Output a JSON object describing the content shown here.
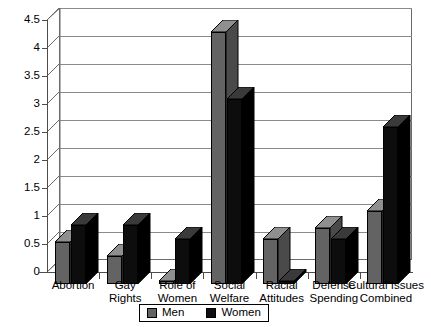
{
  "chart_data": {
    "type": "bar",
    "title": "",
    "subtitle": "",
    "xlabel": "",
    "ylabel": "",
    "ylim": [
      0,
      4.5
    ],
    "ytick_values": [
      0,
      0.5,
      1,
      1.5,
      2,
      2.5,
      3,
      3.5,
      4,
      4.5
    ],
    "ytick_labels": [
      "0",
      "0.5",
      "1",
      "1.5",
      "2",
      "2.5",
      "3",
      "3.5",
      "4",
      "4.5"
    ],
    "grid": true,
    "legend_position": "bottom",
    "style": "3d-clustered-column",
    "categories": [
      "Abortion",
      "Gay\nRights",
      "Role of\nWomen",
      "Social\nWelfare",
      "Racial\nAttitudes",
      "Defense\nSpending",
      "Cultural Issues\nCombined"
    ],
    "series": [
      {
        "name": "Men",
        "color": "#636363",
        "values": [
          0.75,
          0.5,
          0.05,
          4.5,
          0.8,
          1.0,
          1.3
        ]
      },
      {
        "name": "Women",
        "color": "#0d0d0d",
        "values": [
          1.05,
          1.05,
          0.8,
          3.3,
          0.05,
          0.8,
          2.8
        ]
      }
    ]
  },
  "legend": {
    "items": [
      {
        "label": "Men",
        "swatch": "men-color-swatch"
      },
      {
        "label": "Women",
        "swatch": "women-color-swatch"
      }
    ]
  },
  "colors": {
    "men": "#636363",
    "women": "#0d0d0d",
    "grid": "#8a8a8a",
    "axis": "#4d4d4d",
    "background": "#ffffff"
  }
}
